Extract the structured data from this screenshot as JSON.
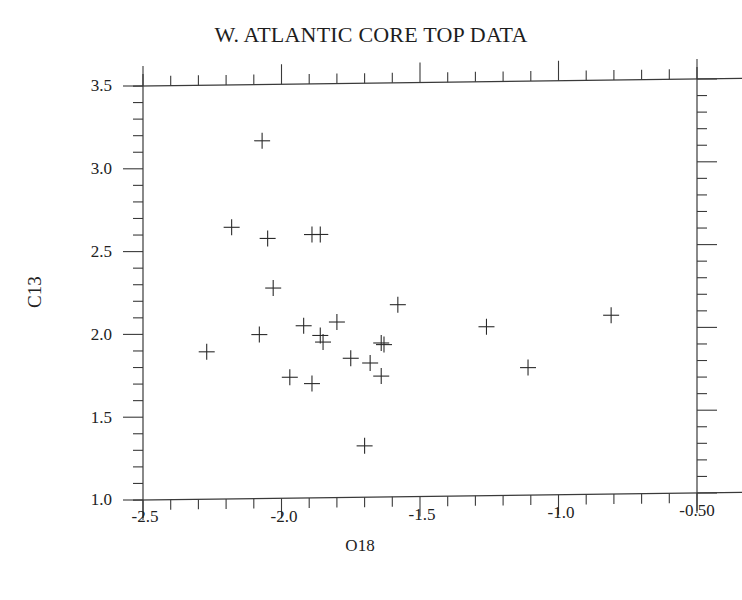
{
  "chart_data": {
    "type": "scatter",
    "title": "W. ATLANTIC CORE TOP DATA",
    "xlabel": "O18",
    "ylabel": "C13",
    "xlim": [
      -2.5,
      -0.5
    ],
    "ylim": [
      1.0,
      3.5
    ],
    "x_ticks": [
      "-2.5",
      "-2.0",
      "-1.5",
      "-1.0",
      "-0.50"
    ],
    "y_ticks": [
      "1.0",
      "1.5",
      "2.0",
      "2.5",
      "3.0",
      "3.5"
    ],
    "grid": false,
    "legend": null,
    "marker": "plus",
    "series": [
      {
        "name": "core top",
        "points": [
          {
            "x": -2.07,
            "y": 3.16
          },
          {
            "x": -2.18,
            "y": 2.64
          },
          {
            "x": -2.05,
            "y": 2.57
          },
          {
            "x": -1.89,
            "y": 2.59
          },
          {
            "x": -1.86,
            "y": 2.59
          },
          {
            "x": -2.03,
            "y": 2.27
          },
          {
            "x": -2.27,
            "y": 1.89
          },
          {
            "x": -2.08,
            "y": 1.99
          },
          {
            "x": -1.92,
            "y": 2.04
          },
          {
            "x": -1.8,
            "y": 2.06
          },
          {
            "x": -1.86,
            "y": 1.98
          },
          {
            "x": -1.85,
            "y": 1.94
          },
          {
            "x": -1.97,
            "y": 1.73
          },
          {
            "x": -1.89,
            "y": 1.69
          },
          {
            "x": -1.75,
            "y": 1.84
          },
          {
            "x": -1.68,
            "y": 1.81
          },
          {
            "x": -1.64,
            "y": 1.93
          },
          {
            "x": -1.63,
            "y": 1.92
          },
          {
            "x": -1.64,
            "y": 1.73
          },
          {
            "x": -1.58,
            "y": 2.16
          },
          {
            "x": -1.7,
            "y": 1.31
          },
          {
            "x": -1.26,
            "y": 2.02
          },
          {
            "x": -1.11,
            "y": 1.77
          },
          {
            "x": -0.81,
            "y": 2.08
          }
        ]
      }
    ]
  },
  "labels": {
    "title": "W. ATLANTIC CORE TOP DATA",
    "xlabel": "O18",
    "ylabel": "C13",
    "x_ticks": [
      "-2.5",
      "-2.0",
      "-1.5",
      "-1.0",
      "-0.50"
    ],
    "y_ticks": [
      "3.5",
      "3.0",
      "2.5",
      "2.0",
      "1.5",
      "1.0"
    ]
  }
}
